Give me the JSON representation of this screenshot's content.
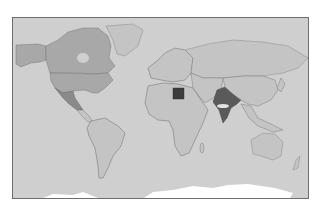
{
  "map": {
    "type": "choropleth",
    "projection": "equirectangular-like world",
    "colors": {
      "ocean": "#cfcfcf",
      "land_default": "#c4c4c4",
      "land_tier1": "#a8a8a8",
      "land_tier2": "#8a8a8a",
      "land_tier3": "#5a5a5a",
      "land_tier4": "#3c3c3c",
      "antarctica": "#ffffff",
      "border": "#6a6a6a",
      "frame": "#6e6e6e"
    },
    "highlighted_regions": [
      {
        "name": "Canada",
        "tier": "land_tier1"
      },
      {
        "name": "United States",
        "tier": "land_tier1"
      },
      {
        "name": "Mexico",
        "tier": "land_tier2"
      },
      {
        "name": "Sudan",
        "tier": "land_tier4"
      },
      {
        "name": "India",
        "tier": "land_tier3"
      }
    ]
  }
}
